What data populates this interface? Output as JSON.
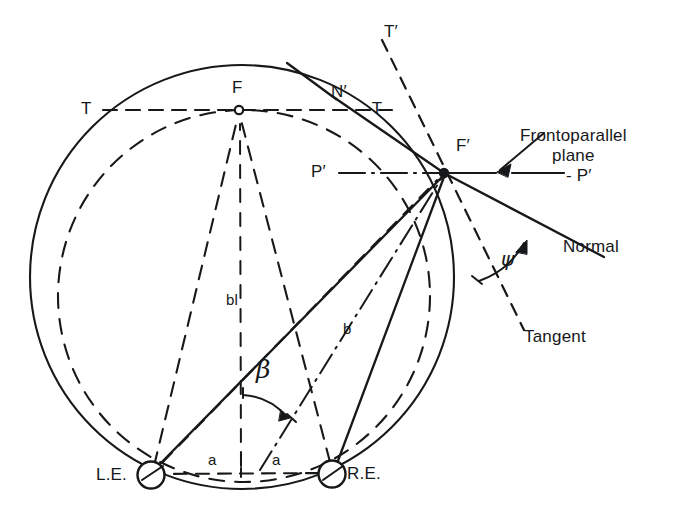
{
  "figure": {
    "type": "geometry-diagram",
    "ink_color": "#16181a",
    "background_color": "#ffffff"
  },
  "points": {
    "fixation": {
      "label": "F",
      "x": 239,
      "y": 110,
      "marker": "open-circle"
    },
    "eccentric": {
      "label": "F'",
      "x": 444,
      "y": 173,
      "marker": "filled-dot"
    },
    "left_eye": {
      "label": "L.E.",
      "x": 151,
      "y": 475,
      "marker": "circle",
      "radius": 13
    },
    "right_eye": {
      "label": "R.E.",
      "x": 332,
      "y": 474,
      "marker": "circle",
      "radius": 13
    }
  },
  "labels": {
    "t_left": "T",
    "n_prime": "N′",
    "t_right": "-T",
    "t_prime": "T′",
    "p_left": "P′",
    "p_right": "- P′",
    "f": "F",
    "f_prime": "F′",
    "frontoparallel": "Frontoparallel\nplane",
    "normal": "Normal",
    "tangent": "Tangent",
    "psi": "ψ",
    "beta": "β",
    "bl": "bl",
    "b": "b",
    "a_left": "a",
    "a_right": "a",
    "le": "L.E.",
    "re": "R.E."
  },
  "geometry": {
    "vieth_muller_circle": {
      "cx": 242,
      "cy": 277,
      "r": 212,
      "style": "solid"
    },
    "horopter_circle": {
      "cx": 244,
      "cy": 296,
      "r": 186,
      "style": "dashed"
    },
    "interocular_axis": {
      "from": [
        151,
        475
      ],
      "to": [
        332,
        474
      ],
      "style": "dashed",
      "segments_label": [
        "a",
        "a"
      ]
    },
    "horizontal_through_F": {
      "y": 110,
      "from_x": 100,
      "to_x": 395,
      "style": "dashed",
      "endpoints": [
        "T",
        "-T"
      ]
    },
    "frontoparallel_line": {
      "y": 173,
      "from_x": 338,
      "to_x": 566,
      "style": "dash-dot",
      "endpoints": [
        "P′",
        "- P′"
      ]
    },
    "normal_line": {
      "from": [
        444,
        173
      ],
      "to": [
        600,
        262
      ],
      "style": "solid",
      "label": "Normal"
    },
    "tangent_line": {
      "from": [
        385,
        38
      ],
      "to": [
        520,
        320
      ],
      "style": "dashed",
      "label": "Tangent"
    },
    "angle_psi": {
      "vertex": [
        444,
        173
      ],
      "label": "ψ",
      "between": [
        "tangent",
        "normal"
      ]
    },
    "angle_beta": {
      "vertex": [
        151,
        475
      ],
      "label": "β",
      "between": [
        "median-line",
        "line-to-F′"
      ]
    },
    "distance_bl": {
      "label": "bl",
      "from": [
        242,
        460
      ],
      "to": [
        242,
        118
      ]
    },
    "distance_b": {
      "label": "b",
      "from": [
        332,
        474
      ],
      "to": [
        444,
        173
      ]
    }
  }
}
